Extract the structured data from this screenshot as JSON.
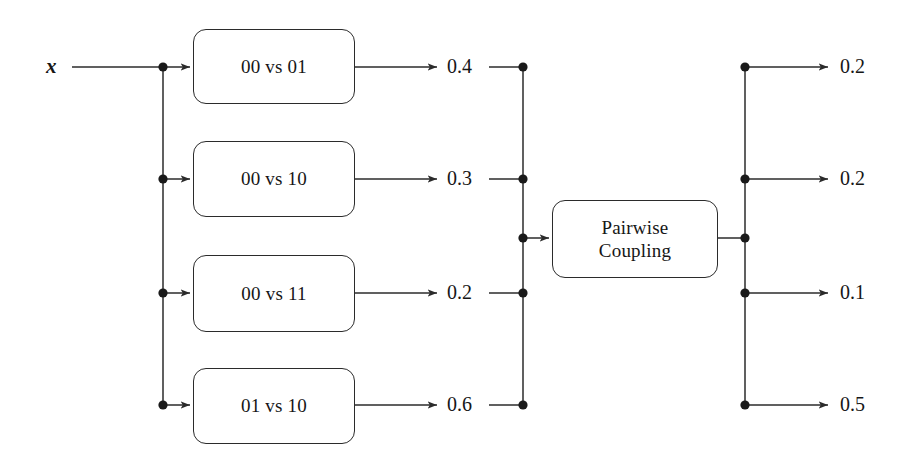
{
  "diagram": {
    "input": {
      "label": "x"
    },
    "classifiers": [
      {
        "label": "00 vs 01"
      },
      {
        "label": "00 vs 10"
      },
      {
        "label": "00 vs 11"
      },
      {
        "label": "01 vs 10"
      }
    ],
    "pairwise_outputs": [
      "0.4",
      "0.3",
      "0.2",
      "0.6"
    ],
    "coupling": {
      "line1": "Pairwise",
      "line2": "Coupling"
    },
    "class_probabilities": [
      "0.2",
      "0.2",
      "0.1",
      "0.5"
    ],
    "colors": {
      "stroke": "#2b2b2b",
      "text": "#161616",
      "background": "#ffffff"
    }
  }
}
